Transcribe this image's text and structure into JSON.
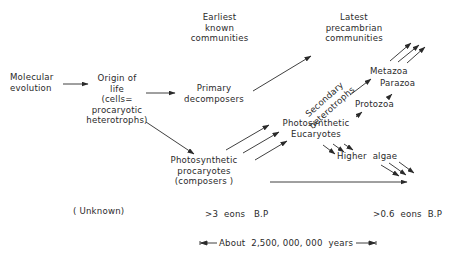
{
  "nodes": {
    "molecular_evolution": "Molecular\nevolution",
    "origin_of_life": "Origin of\nlife\n(cells=\nprocaryotic\nheterotrophs)",
    "earliest_communities": "Earliest\nknown\ncommunities",
    "primary_decomposers": "Primary\ndecomposers",
    "photosynthetic_procaryotes": "Photosynthetic\nprocaryotes\n(composers )",
    "secondary_heterotrophs": "Secondary\nheterotrophs",
    "latest_precambrian": "Latest\nprecambrian\ncommunities",
    "photosynthetic_eucaryotes": "Photosynthetic\nEucaryotes",
    "metazoa": "Metazoa",
    "parazoa": "Parazoa",
    "protozoa": "Protozoa",
    "higher_algae": "Higher  algae"
  },
  "timeline": {
    "unknown": "( Unknown)",
    "early": ">3  eons   B.P",
    "late": ">0.6  eons  B.P",
    "span": "About  2,500, 000, 000  years"
  },
  "colors": {
    "ink": "#2a2a2a",
    "background": "#ffffff"
  }
}
